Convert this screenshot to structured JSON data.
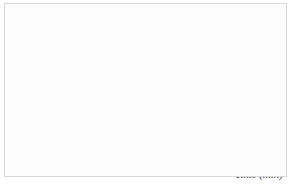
{
  "figure": {
    "background_color": "#fdfdfd",
    "border_color": "#d8d8d8",
    "axis_color": "#3a3a3a",
    "grid_color": "#e4e4e4",
    "band_fill": "#9a9a9a",
    "band_stroke": "#333333",
    "curve_color": "#111111"
  },
  "annotations": {
    "alloy": "AlFe0.5Si0.15",
    "strain": "ε = 80%",
    "strain_symbol": "ε",
    "strain_value": "80%",
    "curve1_label": "1",
    "curve2_label": "2",
    "Ti_label": "T",
    "Ti_sub": "i",
    "ti_label": "t",
    "ti_sub": "i"
  },
  "chart_data": {
    "type": "line",
    "title": "",
    "xlabel": "Time (min)",
    "ylabel": "T(°C)",
    "ylabel_symbol": "T",
    "ylabel_unit": "(°C)",
    "xscale": "log",
    "xlim": [
      0.01,
      100
    ],
    "ylim": [
      300,
      500
    ],
    "grid": true,
    "grid_style": "minor-log-vertical",
    "legend": "none",
    "xticks": [
      {
        "value": 0.01,
        "mantissa": "10",
        "exponent": "−2",
        "label": "10⁻²"
      },
      {
        "value": 0.1,
        "mantissa": "10",
        "exponent": "−1",
        "label": "10⁻¹"
      },
      {
        "value": 1,
        "mantissa": "10",
        "exponent": "0",
        "label": "10⁰"
      },
      {
        "value": 10,
        "mantissa": "10",
        "exponent": "1",
        "label": "10¹"
      },
      {
        "value": 100,
        "mantissa": "10",
        "exponent": "2",
        "label": "10²"
      }
    ],
    "yticks": [
      {
        "value": 300,
        "label": "300"
      },
      {
        "value": 350,
        "label": "350"
      },
      {
        "value": 400,
        "label": "400"
      },
      {
        "value": 450,
        "label": "450"
      },
      {
        "value": 500,
        "label": "500"
      }
    ],
    "reference_lines": [
      {
        "name": "Ti",
        "orientation": "horizontal",
        "value": 450,
        "style": "dotted",
        "x_end": 0.085
      },
      {
        "name": "ti",
        "orientation": "vertical",
        "value": 0.085,
        "style": "dotted",
        "y_end": 450
      }
    ],
    "series": [
      {
        "name": "1",
        "type": "C-curve (recrystallization start)",
        "points": [
          [
            0.24,
            500
          ],
          [
            0.16,
            487
          ],
          [
            0.115,
            473
          ],
          [
            0.092,
            460
          ],
          [
            0.082,
            450
          ],
          [
            0.072,
            435
          ],
          [
            0.065,
            420
          ],
          [
            0.063,
            405
          ],
          [
            0.066,
            390
          ],
          [
            0.075,
            373
          ],
          [
            0.093,
            355
          ],
          [
            0.125,
            338
          ],
          [
            0.18,
            321
          ],
          [
            0.27,
            305
          ],
          [
            0.36,
            297
          ]
        ]
      },
      {
        "name": "1-upper",
        "type": "growth curve (ascending branch)",
        "points": [
          [
            0.082,
            450
          ],
          [
            0.11,
            462
          ],
          [
            0.15,
            474
          ],
          [
            0.22,
            484
          ],
          [
            0.34,
            492
          ],
          [
            0.55,
            498
          ],
          [
            0.9,
            503
          ]
        ]
      },
      {
        "name": "2",
        "type": "band-upper",
        "points": [
          [
            0.068,
            480
          ],
          [
            0.1,
            470
          ],
          [
            0.17,
            456
          ],
          [
            0.3,
            441
          ],
          [
            0.6,
            424
          ],
          [
            1.3,
            406
          ],
          [
            3.0,
            389
          ],
          [
            7.0,
            374
          ],
          [
            15.0,
            363
          ],
          [
            30.0,
            355
          ]
        ]
      },
      {
        "name": "2",
        "type": "band-lower",
        "points": [
          [
            0.068,
            470
          ],
          [
            0.1,
            458
          ],
          [
            0.17,
            443
          ],
          [
            0.3,
            427
          ],
          [
            0.6,
            409
          ],
          [
            1.3,
            391
          ],
          [
            3.0,
            373
          ],
          [
            7.0,
            358
          ],
          [
            15.0,
            347
          ],
          [
            30.0,
            341
          ]
        ]
      }
    ]
  }
}
